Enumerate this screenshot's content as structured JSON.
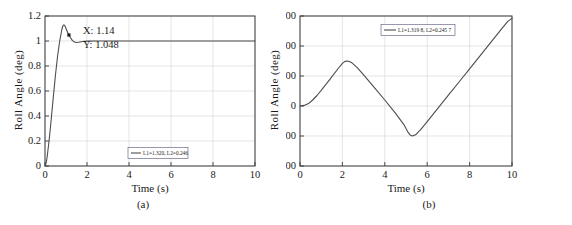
{
  "figure": {
    "panels": [
      {
        "caption": "(a)",
        "chart_data": {
          "type": "line",
          "title": "",
          "xlabel": "Time (s)",
          "ylabel": "Roll Angle (deg)",
          "xlim": [
            0,
            10
          ],
          "ylim": [
            0,
            1.2
          ],
          "xticks": [
            "0",
            "2",
            "4",
            "6",
            "8",
            "10"
          ],
          "xtick_values": [
            0,
            2,
            4,
            6,
            8,
            10
          ],
          "yticks": [
            "0",
            "0.2",
            "0.4",
            "0.6",
            "0.8",
            "1",
            "1.2"
          ],
          "ytick_values": [
            0,
            0.2,
            0.4,
            0.6,
            0.8,
            1,
            1.2
          ],
          "grid": true,
          "legend_position": "lower-center",
          "series": [
            {
              "name": "L1=1.320, L2=0.246",
              "x": [
                0,
                0.05,
                0.1,
                0.2,
                0.3,
                0.4,
                0.5,
                0.6,
                0.7,
                0.8,
                0.85,
                0.9,
                0.95,
                1.0,
                1.05,
                1.1,
                1.14,
                1.2,
                1.3,
                1.4,
                1.5,
                1.6,
                1.8,
                2.0,
                2.5,
                3.0,
                4.0,
                5.0,
                6.0,
                7.0,
                8.0,
                9.0,
                10.0
              ],
              "y": [
                0.0,
                0.02,
                0.07,
                0.21,
                0.38,
                0.56,
                0.73,
                0.88,
                1.0,
                1.09,
                1.12,
                1.13,
                1.12,
                1.1,
                1.08,
                1.06,
                1.048,
                1.03,
                1.005,
                0.992,
                0.988,
                0.99,
                0.996,
                0.999,
                1.0,
                1.0,
                1.0,
                1.0,
                1.0,
                1.0,
                1.0,
                1.0,
                1.0
              ]
            }
          ],
          "annotations": [
            {
              "name": "data-tip",
              "x_label": "X: 1.14",
              "y_label": "Y: 1.048",
              "x": 1.14,
              "y": 1.048
            }
          ]
        }
      },
      {
        "caption": "(b)",
        "chart_data": {
          "type": "line",
          "title": "",
          "xlabel": "Time (s)",
          "ylabel": "Roll Angle (deg)",
          "xlim": [
            0,
            10
          ],
          "ylim": [
            -200,
            300
          ],
          "xticks": [
            "0",
            "2",
            "4",
            "6",
            "8",
            "10"
          ],
          "xtick_values": [
            0,
            2,
            4,
            6,
            8,
            10
          ],
          "yticks": [
            "-200",
            "-100",
            "0",
            "100",
            "200",
            "300"
          ],
          "ytick_values": [
            -200,
            -100,
            0,
            100,
            200,
            300
          ],
          "grid": true,
          "legend_position": "upper-center",
          "series": [
            {
              "name": "L1=1.319 8, L2=0.245 7",
              "x": [
                0,
                0.2,
                0.4,
                0.6,
                0.8,
                1.0,
                1.4,
                1.8,
                2.0,
                2.1,
                2.2,
                2.3,
                2.45,
                2.7,
                3.0,
                3.5,
                4.0,
                4.5,
                4.9,
                5.1,
                5.2,
                5.3,
                5.45,
                5.7,
                6.0,
                6.5,
                7.0,
                7.5,
                8.0,
                8.5,
                9.0,
                9.5,
                9.8,
                10.0
              ],
              "y": [
                0,
                2,
                8,
                20,
                35,
                52,
                88,
                125,
                142,
                148,
                150,
                149,
                144,
                128,
                104,
                62,
                20,
                -24,
                -62,
                -88,
                -97,
                -100,
                -96,
                -78,
                -52,
                -8,
                36,
                80,
                124,
                168,
                212,
                256,
                282,
                292
              ]
            }
          ],
          "annotations": []
        }
      }
    ]
  }
}
